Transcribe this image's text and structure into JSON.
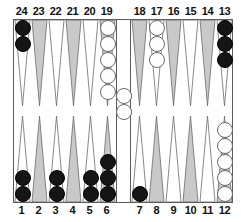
{
  "board": {
    "title": "Backgammon board position",
    "top_left_numbers": [
      "24",
      "23",
      "22",
      "21",
      "20",
      "19"
    ],
    "top_right_numbers": [
      "18",
      "17",
      "16",
      "15",
      "14",
      "13"
    ],
    "bottom_left_numbers": [
      "1",
      "2",
      "3",
      "4",
      "5",
      "6"
    ],
    "bottom_right_numbers": [
      "7",
      "8",
      "9",
      "10",
      "11",
      "12"
    ],
    "colors": {
      "black_checker": "#151515",
      "white_checker": "#fdfdfd",
      "point_shaded": "#c9c9c9",
      "point_light": "#ffffff",
      "frame_line": "#5a5a5a",
      "background": "#ffffff",
      "label_text": "#111111"
    },
    "points": [
      {
        "number": "24",
        "row": "top",
        "half": "left",
        "index": 0,
        "shade": "light",
        "checkers": 2,
        "color": "black"
      },
      {
        "number": "23",
        "row": "top",
        "half": "left",
        "index": 1,
        "shade": "shaded",
        "checkers": 0,
        "color": null
      },
      {
        "number": "22",
        "row": "top",
        "half": "left",
        "index": 2,
        "shade": "light",
        "checkers": 0,
        "color": null
      },
      {
        "number": "21",
        "row": "top",
        "half": "left",
        "index": 3,
        "shade": "shaded",
        "checkers": 0,
        "color": null
      },
      {
        "number": "20",
        "row": "top",
        "half": "left",
        "index": 4,
        "shade": "light",
        "checkers": 0,
        "color": null
      },
      {
        "number": "19",
        "row": "top",
        "half": "left",
        "index": 5,
        "shade": "shaded",
        "checkers": 5,
        "color": "white"
      },
      {
        "number": "18",
        "row": "top",
        "half": "right",
        "index": 0,
        "shade": "shaded",
        "checkers": 0,
        "color": null
      },
      {
        "number": "17",
        "row": "top",
        "half": "right",
        "index": 1,
        "shade": "light",
        "checkers": 3,
        "color": "white"
      },
      {
        "number": "16",
        "row": "top",
        "half": "right",
        "index": 2,
        "shade": "shaded",
        "checkers": 0,
        "color": null
      },
      {
        "number": "15",
        "row": "top",
        "half": "right",
        "index": 3,
        "shade": "light",
        "checkers": 0,
        "color": null
      },
      {
        "number": "14",
        "row": "top",
        "half": "right",
        "index": 4,
        "shade": "shaded",
        "checkers": 0,
        "color": null
      },
      {
        "number": "13",
        "row": "top",
        "half": "right",
        "index": 5,
        "shade": "light",
        "checkers": 3,
        "color": "black"
      },
      {
        "number": "1",
        "row": "bottom",
        "half": "left",
        "index": 0,
        "shade": "light",
        "checkers": 2,
        "color": "black"
      },
      {
        "number": "2",
        "row": "bottom",
        "half": "left",
        "index": 1,
        "shade": "shaded",
        "checkers": 0,
        "color": null
      },
      {
        "number": "3",
        "row": "bottom",
        "half": "left",
        "index": 2,
        "shade": "light",
        "checkers": 2,
        "color": "black"
      },
      {
        "number": "4",
        "row": "bottom",
        "half": "left",
        "index": 3,
        "shade": "shaded",
        "checkers": 0,
        "color": null
      },
      {
        "number": "5",
        "row": "bottom",
        "half": "left",
        "index": 4,
        "shade": "light",
        "checkers": 2,
        "color": "black"
      },
      {
        "number": "6",
        "row": "bottom",
        "half": "left",
        "index": 5,
        "shade": "shaded",
        "checkers": 3,
        "color": "black"
      },
      {
        "number": "7",
        "row": "bottom",
        "half": "right",
        "index": 0,
        "shade": "light",
        "checkers": 1,
        "color": "black"
      },
      {
        "number": "8",
        "row": "bottom",
        "half": "right",
        "index": 1,
        "shade": "shaded",
        "checkers": 0,
        "color": null
      },
      {
        "number": "9",
        "row": "bottom",
        "half": "right",
        "index": 2,
        "shade": "light",
        "checkers": 0,
        "color": null
      },
      {
        "number": "10",
        "row": "bottom",
        "half": "right",
        "index": 3,
        "shade": "shaded",
        "checkers": 0,
        "color": null
      },
      {
        "number": "11",
        "row": "bottom",
        "half": "right",
        "index": 4,
        "shade": "light",
        "checkers": 0,
        "color": null
      },
      {
        "number": "12",
        "row": "bottom",
        "half": "right",
        "index": 5,
        "shade": "shaded",
        "checkers": 5,
        "color": "white"
      }
    ],
    "bar": {
      "checkers": 2,
      "color": "white",
      "position": "upper"
    },
    "totals": {
      "black": 15,
      "white": 15
    }
  }
}
